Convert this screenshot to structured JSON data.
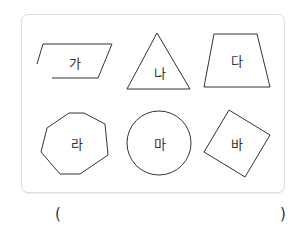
{
  "shapes": [
    {
      "id": "ga",
      "label": "가",
      "type": "parallelogram"
    },
    {
      "id": "na",
      "label": "나",
      "type": "triangle"
    },
    {
      "id": "da",
      "label": "다",
      "type": "trapezoid"
    },
    {
      "id": "ra",
      "label": "라",
      "type": "heptagon"
    },
    {
      "id": "ma",
      "label": "마",
      "type": "circle"
    },
    {
      "id": "ba",
      "label": "바",
      "type": "rotated-square"
    }
  ],
  "answer": {
    "open": "(",
    "close": ")",
    "value": ""
  },
  "colors": {
    "stroke": "#333333",
    "border": "#dcdcdc"
  }
}
